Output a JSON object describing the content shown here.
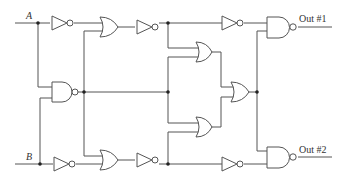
{
  "diagram": {
    "type": "logic-circuit",
    "inputs": [
      {
        "id": "A",
        "label": "A"
      },
      {
        "id": "B",
        "label": "B"
      }
    ],
    "outputs": [
      {
        "id": "out1",
        "label": "Out #1"
      },
      {
        "id": "out2",
        "label": "Out #2"
      }
    ],
    "gates": [
      {
        "id": "not_a",
        "type": "NOT",
        "input": "A"
      },
      {
        "id": "or_top",
        "type": "OR",
        "inputs": [
          "not_a",
          "nand_mid"
        ]
      },
      {
        "id": "not_top",
        "type": "NOT",
        "input": "or_top"
      },
      {
        "id": "nand_mid",
        "type": "NAND",
        "inputs": [
          "A",
          "B"
        ]
      },
      {
        "id": "not_b",
        "type": "NOT",
        "input": "B"
      },
      {
        "id": "or_bot",
        "type": "OR",
        "inputs": [
          "nand_mid",
          "not_b"
        ]
      },
      {
        "id": "not_bot",
        "type": "NOT",
        "input": "or_bot"
      },
      {
        "id": "or_upper",
        "type": "OR",
        "inputs": [
          "not_top",
          "nand_mid"
        ]
      },
      {
        "id": "or_lower",
        "type": "OR",
        "inputs": [
          "nand_mid",
          "not_bot"
        ]
      },
      {
        "id": "or_right",
        "type": "OR",
        "inputs": [
          "or_upper",
          "or_lower"
        ]
      },
      {
        "id": "not_top2",
        "type": "NOT",
        "input": "not_top"
      },
      {
        "id": "not_bot2",
        "type": "NOT",
        "input": "not_bot"
      },
      {
        "id": "nand_out1",
        "type": "NAND",
        "inputs": [
          "not_top2",
          "or_right"
        ]
      },
      {
        "id": "nand_out2",
        "type": "NAND",
        "inputs": [
          "or_right",
          "not_bot2"
        ]
      }
    ]
  },
  "labels": {
    "input_a": "A",
    "input_b": "B",
    "out1": "Out #1",
    "out2": "Out #2"
  }
}
